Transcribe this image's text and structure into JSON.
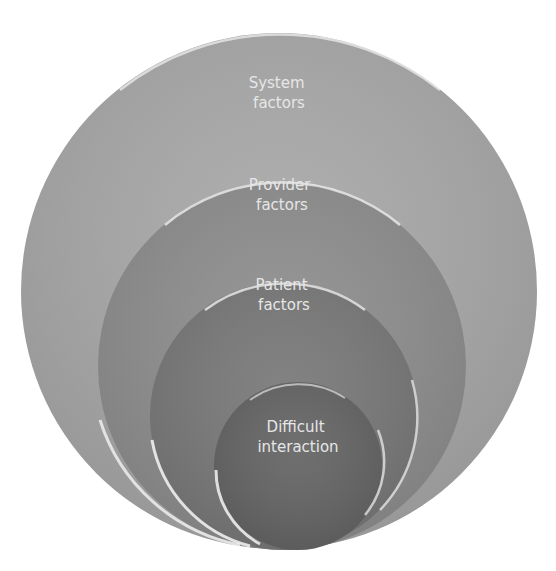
{
  "diagram": {
    "type": "nested-circles",
    "circles": [
      {
        "id": "system",
        "lines": [
          "System",
          "factors"
        ],
        "cx": 279,
        "cy": 291,
        "r": 258,
        "fill": "#a9a9a9",
        "label_y": 88
      },
      {
        "id": "provider",
        "lines": [
          "Provider",
          "factors"
        ],
        "cx": 282,
        "cy": 366,
        "r": 184,
        "fill": "#8f8f8f",
        "label_y": 190
      },
      {
        "id": "patient",
        "lines": [
          "Patient",
          "factors"
        ],
        "cx": 284,
        "cy": 416,
        "r": 134,
        "fill": "#7a7a7a",
        "label_y": 290
      },
      {
        "id": "difficult",
        "lines": [
          "Difficult",
          "interaction"
        ],
        "cx": 298,
        "cy": 466,
        "r": 84,
        "fill": "#666666",
        "label_y": 432
      }
    ],
    "colors": {
      "background": "#ffffff",
      "text": "#e6e6e6",
      "highlight": "#f4f4f4"
    }
  }
}
